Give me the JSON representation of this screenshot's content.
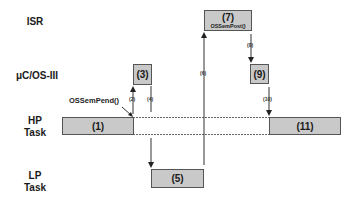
{
  "rows": {
    "isr": "ISR",
    "kernel": "μC/OS-III",
    "hp_task": [
      "HP",
      "Task"
    ],
    "lp_task": [
      "LP",
      "Task"
    ]
  },
  "boxes": {
    "b1": "(1)",
    "b3": "(3)",
    "b5": "(5)",
    "b7": "(7)",
    "b7_sub": "OSSemPost()",
    "b9": "(9)",
    "b11": "(11)"
  },
  "steps": {
    "s2": "(2)",
    "s4": "(4)",
    "s6": "(6)",
    "s8": "(8)",
    "s10": "(10)"
  },
  "annotations": {
    "pend_call": "OSSemPend()"
  },
  "colors": {
    "box_fill": "#c9c9c9",
    "box_border": "#555555",
    "line": "#333333"
  }
}
